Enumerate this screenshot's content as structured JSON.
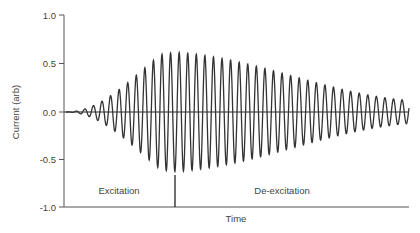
{
  "chart_data": {
    "type": "line",
    "title": "",
    "xlabel": "Time",
    "ylabel": "Current (arb)",
    "ylim": [
      -1.0,
      1.0
    ],
    "yticks": [
      1.0,
      0.5,
      0.0,
      -0.5,
      -1.0
    ],
    "ytick_labels": [
      "1.0",
      "0.5",
      "0.0",
      "-0.5",
      "-1.0"
    ],
    "xticks": [],
    "grid": false,
    "legend": null,
    "series": [
      {
        "name": "Current",
        "description": "Sinusoidal oscillation with envelope rising from 0 to ~0.62 during excitation, then decaying to ~0.12 during de-excitation",
        "cycles": 40,
        "envelope": {
          "t_fraction": [
            0.0,
            0.33,
            1.0
          ],
          "amplitude": [
            0.0,
            0.62,
            0.12
          ]
        }
      }
    ],
    "annotations": [
      {
        "text": "Excitation",
        "region": "left of marker"
      },
      {
        "text": "De-excitation",
        "region": "right of marker"
      }
    ],
    "marker": {
      "type": "vertical-line",
      "t_fraction": 0.32,
      "y_from": -1.0,
      "y_to": -0.65
    }
  },
  "labels": {
    "ylabel": "Current (arb)",
    "xlabel": "Time",
    "excitation": "Excitation",
    "deexcitation": "De-excitation",
    "y1": "1.0",
    "y05": "0.5",
    "y0": "0.0",
    "ym05": "-0.5",
    "ym1": "-1.0"
  },
  "colors": {
    "axis": "#555555",
    "wave": "#333333",
    "zero_line": "#222222"
  }
}
